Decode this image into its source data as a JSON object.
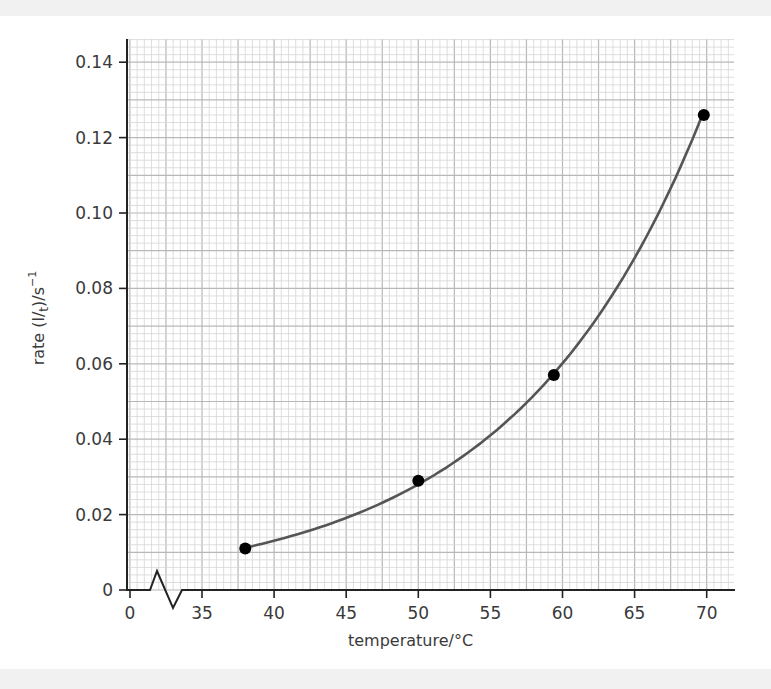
{
  "chart_data": {
    "type": "line",
    "title": "",
    "xlabel": "temperature/°C",
    "ylabel": "rate (1/t)/s⁻¹",
    "ylabel_parts": {
      "main": "rate (",
      "frac_num": "l",
      "frac_den": "t",
      "after": ")/s",
      "sup": "−1"
    },
    "x_ticks": [
      0,
      35,
      40,
      45,
      50,
      55,
      60,
      65,
      70
    ],
    "x_tick_labels": [
      "0",
      "35",
      "40",
      "45",
      "50",
      "55",
      "60",
      "65",
      "70"
    ],
    "y_ticks": [
      0,
      0.02,
      0.04,
      0.06,
      0.08,
      0.1,
      0.12,
      0.14
    ],
    "y_tick_labels": [
      "0",
      "0.02",
      "0.04",
      "0.06",
      "0.08",
      "0.10",
      "0.12",
      "0.14"
    ],
    "xlim": [
      30,
      72
    ],
    "ylim": [
      0,
      0.146
    ],
    "x_axis_break": true,
    "grid": true,
    "legend": null,
    "series": [
      {
        "name": "rate",
        "points": [
          {
            "x": 38,
            "y": 0.011
          },
          {
            "x": 50,
            "y": 0.029
          },
          {
            "x": 59.4,
            "y": 0.057
          },
          {
            "x": 69.8,
            "y": 0.126
          }
        ],
        "fit": "smooth-exponential-curve",
        "line_color": "#555555",
        "marker_color": "#000000"
      }
    ]
  },
  "colors": {
    "grid_minor": "#d6d6d6",
    "grid_major": "#b8b8b8",
    "axis": "#222222",
    "band": "#f1f1f1"
  }
}
